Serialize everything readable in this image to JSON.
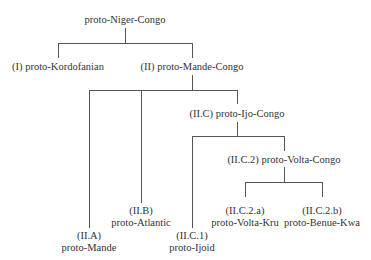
{
  "diagram": {
    "type": "tree",
    "nodes": {
      "root": {
        "line1": "proto-Niger-Congo"
      },
      "kordofanian": {
        "line1": "(I) proto-Kordofanian"
      },
      "mande_congo": {
        "line1": "(II) proto-Mande-Congo"
      },
      "ijo_congo": {
        "line1": "(II.C) proto-Ijo-Congo"
      },
      "volta_congo": {
        "line1": "(II.C.2) proto-Volta-Congo"
      },
      "atlantic": {
        "line1": "(II.B)",
        "line2": "proto-Atlantic"
      },
      "mande": {
        "line1": "(II.A)",
        "line2": "proto-Mande"
      },
      "ijoid": {
        "line1": "(II.C.1)",
        "line2": "proto-Ijoid"
      },
      "volta_kru": {
        "line1": "(II.C.2.a)",
        "line2": "proto-Volta-Kru"
      },
      "benue_kwa": {
        "line1": "(II.C.2.b)",
        "line2": "proto-Benue-Kwa"
      }
    },
    "edges": [
      [
        "root",
        "kordofanian"
      ],
      [
        "root",
        "mande_congo"
      ],
      [
        "mande_congo",
        "mande"
      ],
      [
        "mande_congo",
        "atlantic"
      ],
      [
        "mande_congo",
        "ijo_congo"
      ],
      [
        "ijo_congo",
        "ijoid"
      ],
      [
        "ijo_congo",
        "volta_congo"
      ],
      [
        "volta_congo",
        "volta_kru"
      ],
      [
        "volta_congo",
        "benue_kwa"
      ]
    ]
  }
}
